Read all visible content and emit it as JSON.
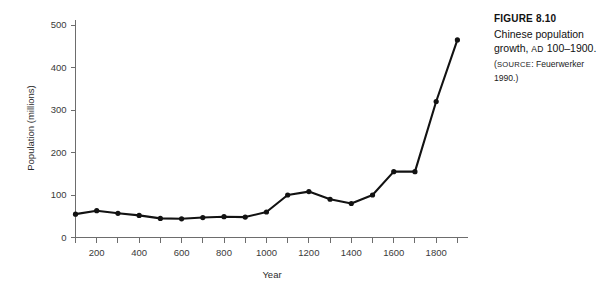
{
  "caption": {
    "figure_number": "FIGURE 8.10",
    "title_part1": "Chinese population growth, ",
    "title_era": "AD",
    "title_part2": " 100–1900.",
    "source_open": "(",
    "source_label": "SOURCE",
    "source_text": ": Feuerwerker 1990.)"
  },
  "chart_data": {
    "type": "line",
    "title": "Chinese population growth, AD 100–1900.",
    "xlabel": "Year",
    "ylabel": "Population (millions)",
    "xlim": [
      100,
      1950
    ],
    "ylim": [
      0,
      520
    ],
    "grid": false,
    "legend": "none",
    "x_major_ticks": [
      200,
      400,
      600,
      800,
      1000,
      1200,
      1400,
      1600,
      1800
    ],
    "x_minor_ticks": [
      100,
      300,
      500,
      700,
      900,
      1100,
      1300,
      1500,
      1700,
      1900
    ],
    "x_tick_labels": [
      "200",
      "400",
      "600",
      "800",
      "1000",
      "1200",
      "1400",
      "1600",
      "1800"
    ],
    "y_ticks": [
      0,
      100,
      200,
      300,
      400,
      500
    ],
    "y_tick_labels": [
      "0",
      "100",
      "200",
      "300",
      "400",
      "500"
    ],
    "x": [
      100,
      200,
      300,
      400,
      500,
      600,
      700,
      800,
      900,
      1000,
      1100,
      1200,
      1300,
      1400,
      1500,
      1600,
      1700,
      1800,
      1900
    ],
    "values": [
      55,
      63,
      57,
      52,
      45,
      44,
      47,
      49,
      48,
      60,
      100,
      108,
      90,
      80,
      100,
      155,
      155,
      320,
      465
    ],
    "series": [
      {
        "name": "Chinese population",
        "values": [
          55,
          63,
          57,
          52,
          45,
          44,
          47,
          49,
          48,
          60,
          100,
          108,
          90,
          80,
          100,
          155,
          155,
          320,
          465
        ]
      }
    ],
    "marker": "circle",
    "line_color": "#121212"
  }
}
